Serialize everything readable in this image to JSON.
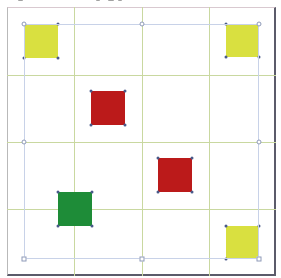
{
  "canvas": {
    "width": 281,
    "height": 278,
    "background": "#ffffff"
  },
  "grid": {
    "rows": 4,
    "cols": 4,
    "line_color": "#c9d8a0",
    "x_lines": [
      7,
      74,
      142,
      209,
      276
    ],
    "y_lines": [
      7,
      75,
      142,
      209,
      276
    ]
  },
  "selection": {
    "x": 24,
    "y": 24,
    "width": 235,
    "height": 235,
    "border_color": "#c8d2e8",
    "handles": [
      {
        "name": "top-left",
        "x": 24,
        "y": 24
      },
      {
        "name": "top-center",
        "x": 142,
        "y": 24
      },
      {
        "name": "top-right",
        "x": 259,
        "y": 24
      },
      {
        "name": "middle-left",
        "x": 24,
        "y": 142
      },
      {
        "name": "middle-right",
        "x": 259,
        "y": 142
      },
      {
        "name": "bottom-left",
        "x": 24,
        "y": 259
      },
      {
        "name": "bottom-center",
        "x": 142,
        "y": 259
      },
      {
        "name": "bottom-right",
        "x": 259,
        "y": 259
      }
    ]
  },
  "colors": {
    "yellow": "#d9e040",
    "red": "#bb1a1a",
    "green": "#1e8c38"
  },
  "shapes": [
    {
      "id": "yellow-top-left",
      "color": "yellow",
      "row": 0,
      "col": 0,
      "x": 24,
      "y": 24,
      "size": 34
    },
    {
      "id": "yellow-top-right",
      "color": "yellow",
      "row": 0,
      "col": 3,
      "x": 226,
      "y": 24,
      "size": 33
    },
    {
      "id": "red-upper",
      "color": "red",
      "row": 1,
      "col": 1,
      "x": 91,
      "y": 91,
      "size": 34
    },
    {
      "id": "red-lower",
      "color": "red",
      "row": 2,
      "col": 2,
      "x": 158,
      "y": 158,
      "size": 34
    },
    {
      "id": "green",
      "color": "green",
      "row": 2,
      "col": 0,
      "x": 58,
      "y": 192,
      "size": 34
    },
    {
      "id": "yellow-bottom-right",
      "color": "yellow",
      "row": 3,
      "col": 3,
      "x": 226,
      "y": 226,
      "size": 33
    }
  ]
}
